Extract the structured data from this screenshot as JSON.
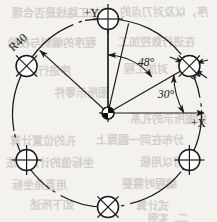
{
  "drawing": {
    "title": "Bolt circle hole pattern drawing",
    "background_color": "#f4f2ee",
    "line_color": "#1a1a1a",
    "axes": {
      "y_label": "+Y",
      "x_label": "+X"
    },
    "dimensions": [
      {
        "id": "bolt-circle-radius",
        "label": "R40",
        "value": 40,
        "type": "radius"
      },
      {
        "id": "hole-diameter",
        "label": "φ8",
        "value": 8,
        "type": "diameter"
      },
      {
        "id": "angle-from-y",
        "label": "48°",
        "value": 48,
        "type": "angle"
      },
      {
        "id": "angle-from-x",
        "label": "30°",
        "value": 30,
        "type": "angle"
      }
    ],
    "geometry": {
      "center_x": 108,
      "center_y": 113,
      "bolt_circle_radius": 94,
      "hole_radius": 10.5,
      "hole_count": 6,
      "hole_spacing_deg": 60,
      "first_hole_angle_deg": 30
    },
    "holes": [
      {
        "name": "hole-30deg",
        "angle": 30,
        "crosshair": "diagonal"
      },
      {
        "name": "hole-90deg",
        "angle": 90,
        "crosshair": "orthogonal"
      },
      {
        "name": "hole-150deg",
        "angle": 150,
        "crosshair": "diagonal"
      },
      {
        "name": "hole-210deg",
        "angle": 210,
        "crosshair": "orthogonal"
      },
      {
        "name": "hole-270deg",
        "angle": 270,
        "crosshair": "diagonal"
      },
      {
        "name": "hole-330deg",
        "angle": 330,
        "crosshair": "orthogonal"
      }
    ],
    "background_bleed": [
      {
        "text": "的加工路线是否合理",
        "x": 12,
        "y": 4,
        "size": 11
      },
      {
        "text": "序，以及对刀点的",
        "x": 120,
        "y": 3,
        "size": 11
      },
      {
        "text": "程序的编制与校验",
        "x": 8,
        "y": 34,
        "size": 11
      },
      {
        "text": "在进行数控加工",
        "x": 118,
        "y": 33,
        "size": 11
      },
      {
        "text": "序进行检查",
        "x": 16,
        "y": 62,
        "size": 11
      },
      {
        "text": "对加工程",
        "x": 124,
        "y": 60,
        "size": 11
      },
      {
        "text": "图所示零件",
        "x": 54,
        "y": 84,
        "size": 11
      },
      {
        "text": "如图所示的孔系",
        "x": 130,
        "y": 110,
        "size": 11
      },
      {
        "text": "孔的位置计算",
        "x": 10,
        "y": 132,
        "size": 11
      },
      {
        "text": "分布在同一圆周上",
        "x": 96,
        "y": 131,
        "size": 11
      },
      {
        "text": "坐标值的计算方法",
        "x": 6,
        "y": 154,
        "size": 11
      },
      {
        "text": "可以用极",
        "x": 140,
        "y": 153,
        "size": 11
      },
      {
        "text": "用直角坐标",
        "x": 12,
        "y": 176,
        "size": 11
      },
      {
        "text": "编程时需要",
        "x": 122,
        "y": 175,
        "size": 11
      },
      {
        "text": "如下所述",
        "x": 30,
        "y": 196,
        "size": 11
      },
      {
        "text": "式计算",
        "x": 136,
        "y": 197,
        "size": 11
      },
      {
        "text": "二、实例",
        "x": 148,
        "y": 210,
        "size": 10
      }
    ]
  }
}
